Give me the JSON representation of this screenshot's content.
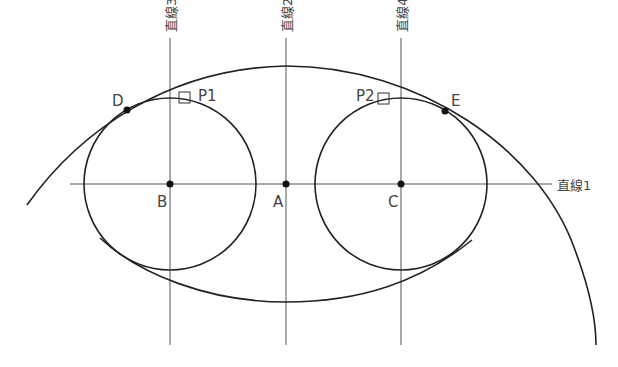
{
  "diagram": {
    "lines": {
      "line1": "直線1",
      "line2": "直線2",
      "line3": "直線3",
      "line4": "直線4"
    },
    "points": {
      "A": "A",
      "B": "B",
      "C": "C",
      "D": "D",
      "E": "E",
      "P1": "P1",
      "P2": "P2"
    },
    "colors": {
      "curve": "#222222",
      "construction_line": "#555555",
      "label": "#444444"
    }
  }
}
